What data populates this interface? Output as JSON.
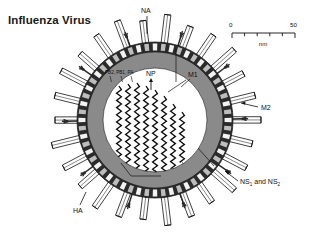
{
  "figure": {
    "title": "Influenza Virus",
    "domain": "diagram"
  },
  "scale_bar": {
    "min_label": "0",
    "max_label": "50",
    "unit": "nm",
    "tick_count": 6
  },
  "labels": {
    "na": "NA",
    "ha": "HA",
    "m1": "M1",
    "m2": "M2",
    "np": "NP",
    "polymerase": "PB2, PB1, PA",
    "ns": "NS",
    "ns_sub1": "1",
    "ns_and": " and NS",
    "ns_sub2": "2"
  },
  "colors": {
    "envelope_dark": "#2b2b2b",
    "matrix_gray": "#8a8a8a",
    "spike_fill": "#ffffff",
    "interior": "#ffffff",
    "ink": "#111111",
    "background": "#ffffff"
  },
  "structure": {
    "virion_center_x": 155,
    "virion_center_y": 120,
    "envelope_outer_r": 78,
    "envelope_inner_r": 68,
    "matrix_outer_r": 68,
    "matrix_inner_r": 52,
    "ha_spike_count": 26,
    "na_spike_count": 10,
    "rnp_columns": 8
  }
}
